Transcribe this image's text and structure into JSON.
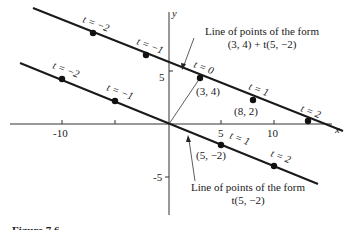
{
  "figure": {
    "axes": {
      "x_label": "x",
      "y_label": "y",
      "x_ticks": [
        "-10",
        "-5",
        "5",
        "10"
      ],
      "y_ticks": [
        "5",
        "-5"
      ]
    },
    "upper_line": {
      "caption_line1": "Line of points of the form",
      "caption_line2": "(3, 4) + t(5, −2)",
      "points": [
        {
          "t_label": "t = −2"
        },
        {
          "t_label": "t = −1"
        },
        {
          "t_label": "t = 0",
          "coord": "(3, 4)"
        },
        {
          "t_label": "t = 1",
          "coord": "(8, 2)"
        },
        {
          "t_label": "t = 2"
        }
      ]
    },
    "lower_line": {
      "caption_line1": "Line of points of the form",
      "caption_line2": "t(5, −2)",
      "points": [
        {
          "t_label": "t = −2"
        },
        {
          "t_label": "t = −1"
        },
        {
          "t_label": "t = 1",
          "coord": "(5, −2)"
        },
        {
          "t_label": "t = 2"
        }
      ]
    },
    "figure_caption": "Figure 7.6"
  }
}
